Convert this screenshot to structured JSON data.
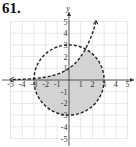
{
  "problem_number": "61.",
  "chart_data": {
    "type": "area",
    "title": "",
    "xlabel": "",
    "ylabel": "y",
    "xlim": [
      -5,
      5
    ],
    "ylim": [
      -5,
      5
    ],
    "grid": true,
    "x_ticks": [
      "-5",
      "-4",
      "-3",
      "-2",
      "-1",
      "1",
      "2",
      "3",
      "4",
      "5"
    ],
    "y_ticks": [
      "5",
      "4",
      "3",
      "2",
      "1",
      "-1",
      "-2",
      "-3",
      "-4",
      "-5"
    ],
    "x_tick_values": [
      -5,
      -4,
      -3,
      -2,
      -1,
      1,
      2,
      3,
      4,
      5
    ],
    "y_tick_values": [
      5,
      4,
      3,
      2,
      1,
      -1,
      -2,
      -3,
      -4,
      -5
    ],
    "series": [
      {
        "name": "circle",
        "equation": "x^2 + y^2 = 9",
        "style": "dashed",
        "center": [
          0,
          0
        ],
        "radius": 3
      },
      {
        "name": "exponential",
        "equation": "y = 2^x",
        "style": "dashed",
        "base": 2,
        "x_range": [
          -4.8,
          2.3
        ]
      }
    ],
    "shaded_region": "inside circle x^2 + y^2 < 9 and below curve y < 2^x",
    "colors": {
      "shade": "#d3d3d3",
      "curve": "#222222",
      "grid": "#d0d0d0",
      "axis": "#333333"
    }
  }
}
